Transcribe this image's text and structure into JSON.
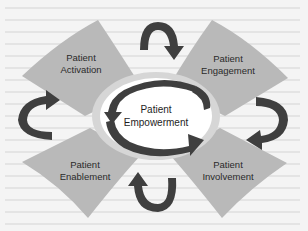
{
  "diagram": {
    "center": {
      "line1": "Patient",
      "line2": "Empowerment"
    },
    "quadrants": [
      {
        "position": "top-left",
        "line1": "Patient",
        "line2": "Activation"
      },
      {
        "position": "top-right",
        "line1": "Patient",
        "line2": "Engagement"
      },
      {
        "position": "bottom-left",
        "line1": "Patient",
        "line2": "Enablement"
      },
      {
        "position": "bottom-right",
        "line1": "Patient",
        "line2": "Involvement"
      }
    ],
    "colors": {
      "petal": "#b9b9b9",
      "arrow": "#3f3f3f",
      "center_fill": "#ffffff",
      "halo": "#d6d6d6",
      "background": "#f4f4f4"
    }
  }
}
